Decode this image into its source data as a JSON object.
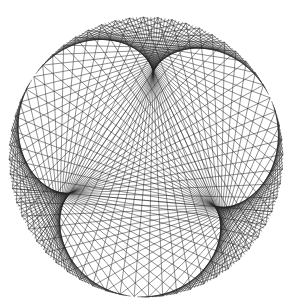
{
  "figure": {
    "caption": "",
    "type": "string-art-times-table",
    "center": [
      146,
      157
    ],
    "radius_x": 137,
    "radius_y": 140,
    "points": 240,
    "multiplier": 4,
    "rotation_deg": 95,
    "stroke_color": "#222222",
    "background": "#ffffff"
  }
}
